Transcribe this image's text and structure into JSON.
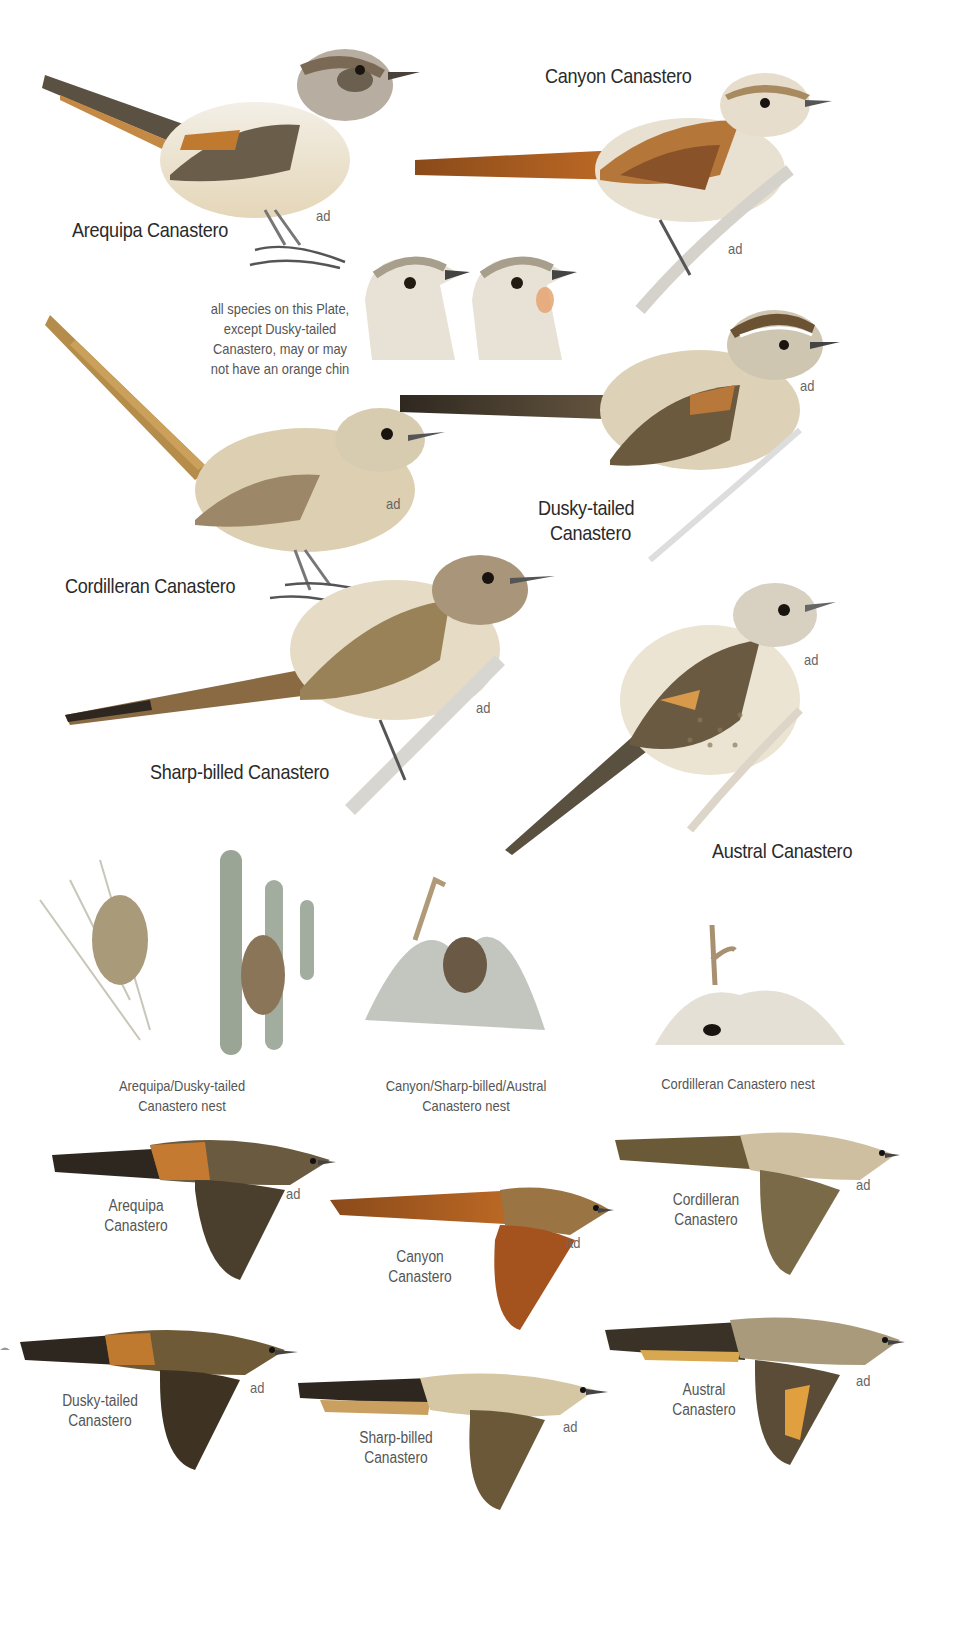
{
  "plate": {
    "note": [
      "all species on this Plate,",
      "except Dusky-tailed",
      "Canastero, may or may",
      "not have an orange chin"
    ],
    "age_label": "ad",
    "perched": [
      {
        "id": "arequipa",
        "name": "Arequipa Canastero"
      },
      {
        "id": "canyon",
        "name": "Canyon Canastero"
      },
      {
        "id": "cordilleran",
        "name": "Cordilleran Canastero"
      },
      {
        "id": "dusky",
        "name_lines": [
          "Dusky-tailed",
          "Canastero"
        ]
      },
      {
        "id": "sharp",
        "name": "Sharp-billed Canastero"
      },
      {
        "id": "austral",
        "name": "Austral Canastero"
      }
    ],
    "heads": [
      {
        "id": "head-plain",
        "description": "plain chin"
      },
      {
        "id": "head-orange",
        "description": "orange chin"
      }
    ],
    "nests": [
      {
        "id": "nest-arequipa-dusky",
        "caption": [
          "Arequipa/Dusky-tailed",
          "Canastero nest"
        ]
      },
      {
        "id": "nest-canyon-sharp-austral",
        "caption": [
          "Canyon/Sharp-billed/Austral",
          "Canastero nest"
        ]
      },
      {
        "id": "nest-cordilleran",
        "caption": [
          "Cordilleran Canastero nest"
        ]
      }
    ],
    "flight": [
      {
        "id": "arequipa",
        "name_lines": [
          "Arequipa",
          "Canastero"
        ]
      },
      {
        "id": "canyon",
        "name_lines": [
          "Canyon",
          "Canastero"
        ]
      },
      {
        "id": "cordilleran",
        "name_lines": [
          "Cordilleran",
          "Canastero"
        ]
      },
      {
        "id": "dusky",
        "name_lines": [
          "Dusky-tailed",
          "Canastero"
        ]
      },
      {
        "id": "sharp",
        "name_lines": [
          "Sharp-billed",
          "Canastero"
        ]
      },
      {
        "id": "austral",
        "name_lines": [
          "Austral",
          "Canastero"
        ]
      }
    ],
    "colors": {
      "text": "#2a2a2a",
      "rufous": "#b8651f",
      "olive_brown": "#8a7a5a",
      "buff": "#d9c9a8",
      "dark_tail": "#3e352a",
      "sage_cactus": "#9aa596"
    }
  }
}
